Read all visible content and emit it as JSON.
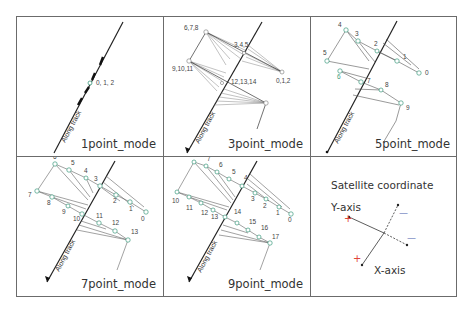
{
  "figure": {
    "panels": [
      {
        "id": "1point",
        "mode_label": "1point_mode",
        "along_track_label": "Along track",
        "point_labels": [
          "0, 1, 2"
        ]
      },
      {
        "id": "3point",
        "mode_label": "3point_mode",
        "along_track_label": "Along track",
        "point_labels": [
          "6,7,8",
          "3,4,5",
          "9,10,11",
          "0,1,2",
          "12,13,14"
        ]
      },
      {
        "id": "5point",
        "mode_label": "5point_mode",
        "along_track_label": "Along track",
        "point_labels": [
          "4",
          "3",
          "2",
          "5",
          "1",
          "0",
          "6",
          "7",
          "8",
          "9"
        ]
      },
      {
        "id": "7point",
        "mode_label": "7point_mode",
        "along_track_label": "Along track",
        "point_labels": [
          "6",
          "5",
          "4",
          "3",
          "7",
          "8",
          "9",
          "2",
          "1",
          "0",
          "10",
          "11",
          "12",
          "13"
        ]
      },
      {
        "id": "9point",
        "mode_label": "9point_mode",
        "along_track_label": "Along track",
        "point_labels": [
          "8",
          "7",
          "6",
          "5",
          "4",
          "3",
          "2",
          "1",
          "0",
          "10",
          "11",
          "12",
          "13",
          "14",
          "15",
          "16",
          "17"
        ]
      }
    ],
    "coordinate_panel": {
      "title": "Satellite coordinate",
      "y_axis_label": "Y-axis",
      "x_axis_label": "X-axis",
      "plus_sign": "+",
      "minus_sign": "—",
      "colors": {
        "plus": "#e0453a",
        "minus": "#4a5fb0"
      }
    }
  },
  "colors": {
    "border": "#6b6b6b",
    "point_stroke": "#3c9b7e",
    "line": "#333333",
    "thin_line": "#888888"
  }
}
